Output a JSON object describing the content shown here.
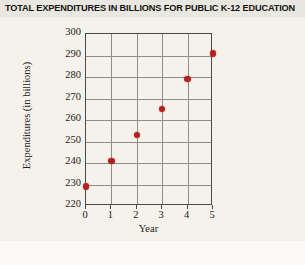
{
  "chart_data": {
    "type": "scatter",
    "title": "TOTAL EXPENDITURES IN BILLIONS FOR PUBLIC K-12 EDUCATION",
    "xlabel": "Year",
    "ylabel": "Expenditures (in billions)",
    "x": [
      0,
      1,
      2,
      3,
      4,
      5
    ],
    "values": [
      229,
      241,
      253,
      265,
      279,
      291
    ],
    "points": [
      {
        "x": 0,
        "y": 229
      },
      {
        "x": 1,
        "y": 241
      },
      {
        "x": 2,
        "y": 253
      },
      {
        "x": 3,
        "y": 265
      },
      {
        "x": 4,
        "y": 279
      },
      {
        "x": 5,
        "y": 291
      }
    ],
    "xlim": [
      0,
      5
    ],
    "ylim": [
      220,
      300
    ],
    "xticks": [
      "0",
      "1",
      "2",
      "3",
      "4",
      "5"
    ],
    "yticks": [
      "220",
      "230",
      "240",
      "250",
      "260",
      "270",
      "280",
      "290",
      "300"
    ],
    "grid": true,
    "legend": null,
    "marker_color": "#b32020"
  }
}
